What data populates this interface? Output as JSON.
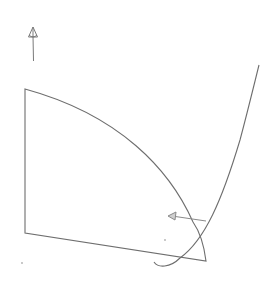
{
  "canvas": {
    "width": 275,
    "height": 286,
    "background": "#ffffff",
    "stroke": "#6e6e6e"
  },
  "shapes": {
    "up_arrow": {
      "label": "up-arrow",
      "x": 33,
      "y_tip": 27,
      "y_tail": 61
    },
    "quarter_region": {
      "label": "quarter-circle-region",
      "top_left": [
        25,
        89
      ],
      "bottom_left": [
        25,
        233
      ],
      "bottom_right": [
        206,
        261
      ]
    },
    "rising_curve": {
      "label": "exponential-curve",
      "start": [
        154,
        264
      ],
      "end": [
        259,
        65
      ]
    },
    "left_arrow": {
      "label": "left-arrow",
      "tip": [
        168,
        216
      ],
      "tail": [
        206,
        221
      ]
    },
    "dots": [
      [
        165,
        240
      ],
      [
        22,
        263
      ]
    ]
  }
}
